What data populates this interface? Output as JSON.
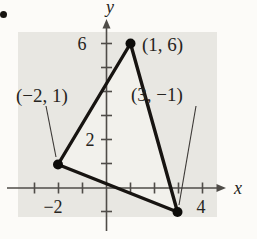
{
  "figure": {
    "axes": {
      "x_label": "x",
      "y_label": "y"
    },
    "ticks": {
      "y_6": "6",
      "y_2": "2",
      "x_neg2": "−2",
      "x_4": "4"
    },
    "points": [
      {
        "label": "(1, 6)",
        "x": 1,
        "y": 6
      },
      {
        "label": "(−2, 1)",
        "x": -2,
        "y": 1
      },
      {
        "label": "(3, −1)",
        "x": 3,
        "y": -1
      }
    ],
    "colors": {
      "plot_background": "#e8e7e2",
      "triangle_fill": "#f2f1ec",
      "triangle_stroke": "#171411",
      "axis": "#4f4c48",
      "text": "#262421"
    }
  }
}
